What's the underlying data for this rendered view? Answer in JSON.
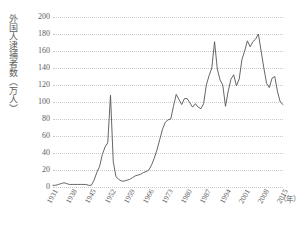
{
  "chart_data": {
    "type": "line",
    "title": "",
    "xlabel": "年",
    "ylabel": "外国人逮捕者数（万人）",
    "ylim": [
      0,
      200
    ],
    "ytick_step": 20,
    "yticks": [
      200,
      180,
      160,
      140,
      120,
      100,
      80,
      60,
      40,
      20,
      0
    ],
    "xlim": [
      1931,
      2015
    ],
    "xticks": [
      1931,
      1938,
      1945,
      1952,
      1959,
      1966,
      1973,
      1980,
      1987,
      1994,
      2001,
      2008,
      2015
    ],
    "grid": true,
    "legend": "none",
    "line_color": "#555555",
    "series": [
      {
        "name": "外国人逮捕者数",
        "x": [
          1931,
          1932,
          1933,
          1934,
          1935,
          1936,
          1937,
          1938,
          1939,
          1940,
          1941,
          1942,
          1943,
          1944,
          1945,
          1946,
          1947,
          1948,
          1949,
          1950,
          1951,
          1952,
          1953,
          1954,
          1955,
          1956,
          1957,
          1958,
          1959,
          1960,
          1961,
          1962,
          1963,
          1964,
          1965,
          1966,
          1967,
          1968,
          1969,
          1970,
          1971,
          1972,
          1973,
          1974,
          1975,
          1976,
          1977,
          1978,
          1979,
          1980,
          1981,
          1982,
          1983,
          1984,
          1985,
          1986,
          1987,
          1988,
          1989,
          1990,
          1991,
          1992,
          1993,
          1994,
          1995,
          1996,
          1997,
          1998,
          1999,
          2000,
          2001,
          2002,
          2003,
          2004,
          2005,
          2006,
          2007,
          2008,
          2009,
          2010,
          2011,
          2012,
          2013,
          2014,
          2015
        ],
        "values": [
          2,
          2,
          3,
          4,
          5,
          4,
          3,
          3,
          3,
          3,
          3,
          3,
          3,
          2,
          2,
          8,
          17,
          24,
          38,
          47,
          52,
          108,
          30,
          12,
          9,
          7,
          7,
          8,
          9,
          11,
          13,
          14,
          15,
          17,
          18,
          20,
          26,
          34,
          44,
          56,
          68,
          76,
          79,
          80,
          95,
          109,
          103,
          97,
          104,
          104,
          99,
          94,
          98,
          94,
          92,
          98,
          120,
          131,
          140,
          171,
          139,
          126,
          120,
          95,
          113,
          127,
          132,
          119,
          127,
          150,
          160,
          172,
          165,
          171,
          174,
          180,
          160,
          140,
          122,
          117,
          128,
          130,
          112,
          100,
          97
        ]
      }
    ],
    "annotations": []
  },
  "axis": {
    "y_title": "外国人逮捕者数（万人）",
    "x_unit": "（年）",
    "yticks": [
      "200",
      "180",
      "160",
      "140",
      "120",
      "100",
      "80",
      "60",
      "40",
      "20",
      "0"
    ],
    "xticks": [
      "1931",
      "1938",
      "1945",
      "1952",
      "1959",
      "1966",
      "1973",
      "1980",
      "1987",
      "1994",
      "2001",
      "2008",
      "2015"
    ]
  }
}
